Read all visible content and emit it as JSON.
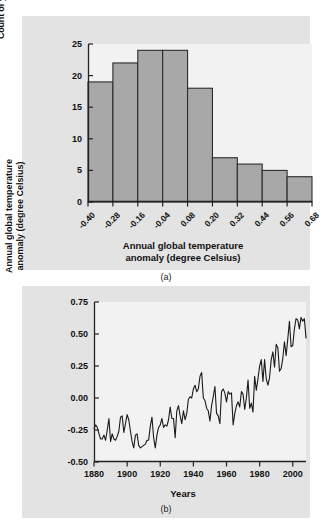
{
  "figure": {
    "background_color": "#ffffff",
    "panel_background": "#e3e3e3",
    "plot_background": "#f2f2f2",
    "bar_fill_color": "#a8a8a8",
    "line_color": "#1a1a1a",
    "axis_color": "#222222"
  },
  "panel_a": {
    "caption": "(a)",
    "chart_data": {
      "type": "bar",
      "title": "",
      "subtitle": "",
      "xlabel": "Annual global temperature\nanomaly (degree Celsius)",
      "ylabel": "Count of years, 1880-2008",
      "categories": [
        "-0.40",
        "-0.28",
        "-0.16",
        "-0.04",
        "0.08",
        "0.20",
        "0.32",
        "0.44",
        "0.56",
        "0.68"
      ],
      "bin_edges": [
        -0.4,
        -0.28,
        -0.16,
        -0.04,
        0.08,
        0.2,
        0.32,
        0.44,
        0.56,
        0.68
      ],
      "bin_width": 0.12,
      "values": [
        19,
        22,
        24,
        24,
        18,
        7,
        6,
        5,
        4
      ],
      "bar_count": 9,
      "xlim": [
        -0.4,
        0.68
      ],
      "ylim": [
        0,
        25
      ],
      "yticks": [
        0,
        5,
        10,
        15,
        20,
        25
      ],
      "ytick_labels": [
        "0",
        "5",
        "10",
        "15",
        "20",
        "25"
      ],
      "xtick_labels": [
        "-0.40",
        "-0.28",
        "-0.16",
        "-0.04",
        "0.08",
        "0.20",
        "0.32",
        "0.44",
        "0.56",
        "0.68"
      ],
      "grid": false,
      "legend": null
    }
  },
  "panel_b": {
    "caption": "(b)",
    "chart_data": {
      "type": "line",
      "title": "",
      "xlabel": "Years",
      "ylabel": "Annual global temperature\nanomaly (degree Celsius)",
      "xlim": [
        1880,
        2008
      ],
      "ylim": [
        -0.5,
        0.75
      ],
      "yticks": [
        -0.5,
        -0.25,
        0.0,
        0.25,
        0.5,
        0.75
      ],
      "ytick_labels": [
        "-0.50",
        "-0.25",
        "0.00",
        "0.25",
        "0.50",
        "0.75"
      ],
      "xticks": [
        1880,
        1900,
        1920,
        1940,
        1960,
        1980,
        2000
      ],
      "xtick_labels": [
        "1880",
        "1900",
        "1920",
        "1940",
        "1960",
        "1980",
        "2000"
      ],
      "grid": false,
      "legend": null,
      "series": [
        {
          "name": "Annual global temperature anomaly",
          "x": [
            1880,
            1881,
            1882,
            1883,
            1884,
            1885,
            1886,
            1887,
            1888,
            1889,
            1890,
            1891,
            1892,
            1893,
            1894,
            1895,
            1896,
            1897,
            1898,
            1899,
            1900,
            1901,
            1902,
            1903,
            1904,
            1905,
            1906,
            1907,
            1908,
            1909,
            1910,
            1911,
            1912,
            1913,
            1914,
            1915,
            1916,
            1917,
            1918,
            1919,
            1920,
            1921,
            1922,
            1923,
            1924,
            1925,
            1926,
            1927,
            1928,
            1929,
            1930,
            1931,
            1932,
            1933,
            1934,
            1935,
            1936,
            1937,
            1938,
            1939,
            1940,
            1941,
            1942,
            1943,
            1944,
            1945,
            1946,
            1947,
            1948,
            1949,
            1950,
            1951,
            1952,
            1953,
            1954,
            1955,
            1956,
            1957,
            1958,
            1959,
            1960,
            1961,
            1962,
            1963,
            1964,
            1965,
            1966,
            1967,
            1968,
            1969,
            1970,
            1971,
            1972,
            1973,
            1974,
            1975,
            1976,
            1977,
            1978,
            1979,
            1980,
            1981,
            1982,
            1983,
            1984,
            1985,
            1986,
            1987,
            1988,
            1989,
            1990,
            1991,
            1992,
            1993,
            1994,
            1995,
            1996,
            1997,
            1998,
            1999,
            2000,
            2001,
            2002,
            2003,
            2004,
            2005,
            2006,
            2007,
            2008
          ],
          "values": [
            -0.24,
            -0.21,
            -0.23,
            -0.28,
            -0.32,
            -0.32,
            -0.29,
            -0.33,
            -0.25,
            -0.16,
            -0.34,
            -0.28,
            -0.32,
            -0.33,
            -0.3,
            -0.26,
            -0.15,
            -0.14,
            -0.27,
            -0.2,
            -0.13,
            -0.17,
            -0.26,
            -0.34,
            -0.39,
            -0.29,
            -0.28,
            -0.37,
            -0.39,
            -0.38,
            -0.37,
            -0.36,
            -0.33,
            -0.33,
            -0.22,
            -0.15,
            -0.31,
            -0.39,
            -0.29,
            -0.23,
            -0.21,
            -0.16,
            -0.23,
            -0.21,
            -0.22,
            -0.17,
            -0.07,
            -0.16,
            -0.16,
            -0.31,
            -0.1,
            -0.06,
            -0.14,
            -0.2,
            -0.1,
            -0.17,
            -0.12,
            -0.01,
            0.01,
            0.0,
            0.07,
            0.1,
            0.05,
            0.07,
            0.17,
            0.2,
            0.0,
            -0.02,
            -0.08,
            -0.1,
            -0.18,
            -0.06,
            0.01,
            0.09,
            -0.12,
            -0.14,
            -0.2,
            0.05,
            0.07,
            0.04,
            -0.03,
            0.05,
            0.03,
            0.04,
            -0.21,
            -0.12,
            -0.06,
            -0.03,
            -0.07,
            0.05,
            0.03,
            -0.09,
            0.0,
            0.14,
            -0.08,
            -0.04,
            -0.11,
            0.17,
            0.06,
            0.15,
            0.25,
            0.3,
            0.13,
            0.3,
            0.15,
            0.1,
            0.16,
            0.3,
            0.36,
            0.24,
            0.42,
            0.39,
            0.21,
            0.23,
            0.31,
            0.44,
            0.33,
            0.46,
            0.6,
            0.4,
            0.41,
            0.54,
            0.62,
            0.61,
            0.54,
            0.63,
            0.6,
            0.62,
            0.47
          ]
        }
      ]
    }
  }
}
